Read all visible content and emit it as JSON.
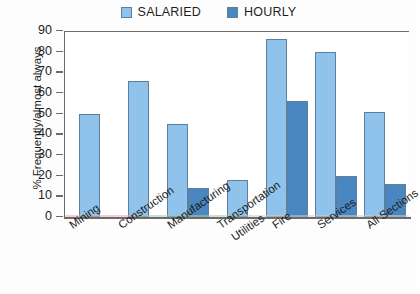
{
  "chart_data": {
    "type": "bar",
    "title": "",
    "xlabel": "",
    "ylabel": "% Frequently/almost always",
    "ylim": [
      0,
      90
    ],
    "yticks": [
      0,
      10,
      20,
      30,
      40,
      50,
      60,
      70,
      80,
      90
    ],
    "grid": false,
    "legend_position": "top-center",
    "categories": [
      "Mining",
      "Construction",
      "Manufacturing",
      "Transportation Utilities",
      "Fire",
      "Services",
      "All Sections"
    ],
    "series": [
      {
        "name": "SALARIED",
        "color": "#8fc3ec",
        "values": [
          50,
          66,
          45,
          18,
          86,
          80,
          51
        ]
      },
      {
        "name": "HOURLY",
        "color": "#4a86c0",
        "values": [
          null,
          null,
          14,
          null,
          56,
          20,
          16
        ]
      }
    ]
  },
  "colors": {
    "salaried": "#8fc3ec",
    "hourly": "#4a86c0",
    "bar_border": "#5d7f9d",
    "axis": "#6b6b6b",
    "background": "#fdfdfd"
  }
}
